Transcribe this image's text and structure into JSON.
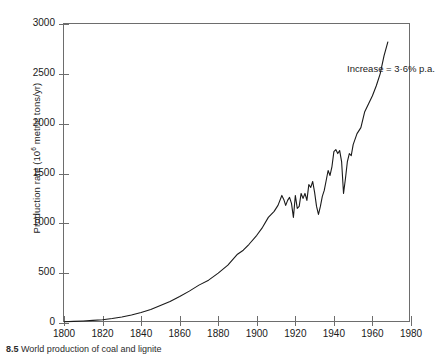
{
  "figure": {
    "caption_number": "8.5",
    "caption_text": "World production of coal and lignite"
  },
  "annotation": {
    "text": "Increase = 3·6% p.a."
  },
  "axes": {
    "ylabel_prefix": "Production rate (10",
    "ylabel_exponent": "6",
    "ylabel_suffix": " metric tons/yr)",
    "yticks": [
      "0",
      "500",
      "1000",
      "1500",
      "2000",
      "2500",
      "3000"
    ],
    "xticks": [
      "1800",
      "1820",
      "1840",
      "1860",
      "1880",
      "1900",
      "1920",
      "1940",
      "1960",
      "1980"
    ]
  },
  "colors": {
    "line": "#1a1a1a",
    "axis": "#6d6d6d",
    "background": "#ffffff"
  },
  "chart_data": {
    "type": "line",
    "title": "",
    "xlabel": "",
    "ylabel": "Production rate (10^6 metric tons/yr)",
    "xlim": [
      1800,
      1980
    ],
    "ylim": [
      0,
      3000
    ],
    "xtick_step": 20,
    "ytick_step": 500,
    "grid": false,
    "legend": false,
    "annotations": [
      {
        "text": "Increase = 3·6% p.a.",
        "x": 1942,
        "y": 2660
      }
    ],
    "series": [
      {
        "name": "World coal and lignite production",
        "x": [
          1800,
          1805,
          1810,
          1815,
          1820,
          1825,
          1830,
          1835,
          1840,
          1845,
          1850,
          1855,
          1860,
          1865,
          1870,
          1875,
          1880,
          1885,
          1890,
          1893,
          1896,
          1900,
          1903,
          1906,
          1909,
          1911,
          1913,
          1914,
          1915,
          1916,
          1917,
          1918,
          1919,
          1920,
          1921,
          1922,
          1923,
          1924,
          1925,
          1926,
          1927,
          1928,
          1929,
          1930,
          1931,
          1932,
          1933,
          1934,
          1935,
          1936,
          1937,
          1938,
          1939,
          1940,
          1941,
          1942,
          1943,
          1944,
          1945,
          1946,
          1947,
          1948,
          1949,
          1950,
          1952,
          1954,
          1956,
          1958,
          1960,
          1962,
          1964,
          1966,
          1968
        ],
        "y": [
          12,
          16,
          20,
          26,
          33,
          45,
          60,
          80,
          105,
          135,
          175,
          215,
          265,
          320,
          380,
          430,
          500,
          580,
          690,
          730,
          790,
          880,
          960,
          1060,
          1120,
          1180,
          1280,
          1240,
          1180,
          1230,
          1260,
          1200,
          1060,
          1280,
          1150,
          1170,
          1300,
          1250,
          1300,
          1230,
          1390,
          1360,
          1420,
          1310,
          1170,
          1090,
          1170,
          1270,
          1330,
          1430,
          1530,
          1480,
          1570,
          1720,
          1740,
          1700,
          1730,
          1620,
          1300,
          1450,
          1620,
          1700,
          1680,
          1790,
          1900,
          1960,
          2120,
          2200,
          2280,
          2380,
          2500,
          2680,
          2820
        ]
      }
    ]
  }
}
